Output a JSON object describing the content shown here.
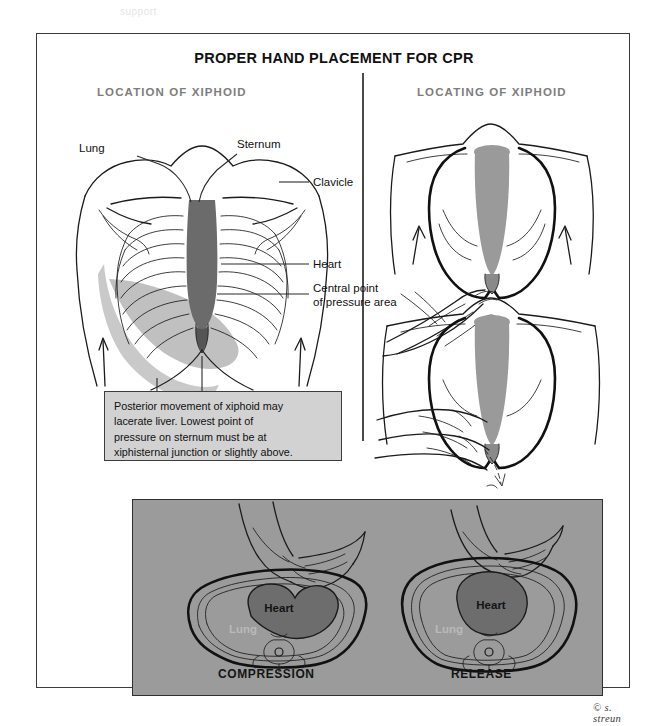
{
  "top_strip": {
    "faint_text": "support"
  },
  "plate": {
    "title": "PROPER HAND PLACEMENT FOR CPR",
    "sections": {
      "left_heading": "LOCATION OF XIPHOID",
      "right_heading": "LOCATING OF XIPHOID"
    },
    "anatomy_labels": {
      "lung": "Lung",
      "sternum": "Sternum",
      "clavicle": "Clavicle",
      "heart": "Heart",
      "central_point": "Central point",
      "central_point_2": "of pressure area",
      "xiphoid": "Xiphoid",
      "liver": "Liver"
    },
    "callout": {
      "line1": "Posterior movement of xiphoid may",
      "line2": "lacerate liver. Lowest point of",
      "line3": "pressure on sternum must be at",
      "line4": "xiphisternal junction or slightly above."
    },
    "cross_sections": {
      "compression_caption": "COMPRESSION",
      "release_caption": "RELEASE",
      "heart_label": "Heart",
      "lung_label": "Lung"
    },
    "credit": "© s. streun"
  },
  "colors": {
    "page_background": "#ffffff",
    "ink": "#1b1b1b",
    "section_heading": "#7d7d7d",
    "callout_fill": "#d2d2d2",
    "panel_grey": "#9b9b9b",
    "organ_dark": "#6b6b6b",
    "organ_mid": "#9a9a9a",
    "organ_light": "#c4c4c4",
    "border": "#3a3a3a"
  }
}
